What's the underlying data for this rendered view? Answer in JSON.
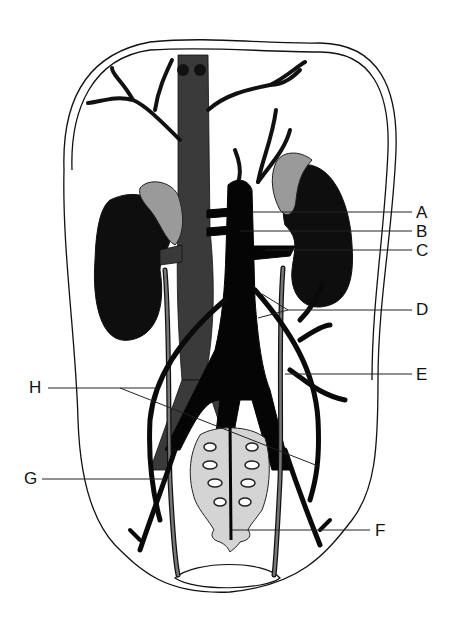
{
  "diagram": {
    "colors": {
      "artery": "#0a0a0a",
      "vein": "#3a3a3a",
      "adrenal": "#9a9a9a",
      "bone": "#d4d4d4",
      "outline": "#111111"
    },
    "labels": [
      {
        "id": "A",
        "text": "A",
        "x": 416,
        "y": 204
      },
      {
        "id": "B",
        "text": "B",
        "x": 416,
        "y": 223
      },
      {
        "id": "C",
        "text": "C",
        "x": 416,
        "y": 242
      },
      {
        "id": "D",
        "text": "D",
        "x": 416,
        "y": 301
      },
      {
        "id": "E",
        "text": "E",
        "x": 416,
        "y": 366
      },
      {
        "id": "F",
        "text": "F",
        "x": 375,
        "y": 522
      },
      {
        "id": "G",
        "text": "G",
        "x": 24,
        "y": 470
      },
      {
        "id": "H",
        "text": "H",
        "x": 29,
        "y": 379
      }
    ]
  }
}
